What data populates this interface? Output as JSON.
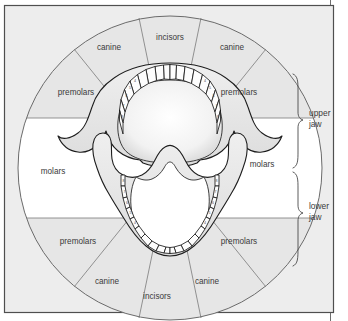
{
  "figure": {
    "frame": {
      "border_color": "#555555",
      "page_background": "#ffffff",
      "plate_background": "#ededed"
    },
    "circle": {
      "center_x": 170,
      "center_y": 168,
      "radius": 152,
      "outline_color": "#6b6b6b",
      "sector_fill": "#e6e6e6",
      "molar_band_fill": "#ffffff"
    }
  },
  "sectors": [
    {
      "id": "incisors-upper",
      "label": "incisors",
      "x": 170,
      "y": 38,
      "group": "incisors",
      "jaw": "upper"
    },
    {
      "id": "canine-upper-left",
      "label": "canine",
      "x": 109,
      "y": 48,
      "group": "canine",
      "jaw": "upper"
    },
    {
      "id": "canine-upper-right",
      "label": "canine",
      "x": 232,
      "y": 48,
      "group": "canine",
      "jaw": "upper"
    },
    {
      "id": "premolars-upper-left",
      "label": "premolars",
      "x": 76,
      "y": 93,
      "group": "premolars",
      "jaw": "upper"
    },
    {
      "id": "premolars-upper-right",
      "label": "premolars",
      "x": 239,
      "y": 93,
      "group": "premolars",
      "jaw": "upper"
    },
    {
      "id": "molars-left",
      "label": "molars",
      "x": 53,
      "y": 172,
      "group": "molars",
      "jaw": "both"
    },
    {
      "id": "molars-right",
      "label": "molars",
      "x": 262,
      "y": 165,
      "group": "molars",
      "jaw": "both"
    },
    {
      "id": "premolars-lower-left",
      "label": "premolars",
      "x": 78,
      "y": 242,
      "group": "premolars",
      "jaw": "lower"
    },
    {
      "id": "premolars-lower-right",
      "label": "premolars",
      "x": 239,
      "y": 242,
      "group": "premolars",
      "jaw": "lower"
    },
    {
      "id": "canine-lower-left",
      "label": "canine",
      "x": 107,
      "y": 282,
      "group": "canine",
      "jaw": "lower"
    },
    {
      "id": "canine-lower-right",
      "label": "canine",
      "x": 207,
      "y": 282,
      "group": "canine",
      "jaw": "lower"
    },
    {
      "id": "incisors-lower",
      "label": "incisors",
      "x": 157,
      "y": 297,
      "group": "incisors",
      "jaw": "lower"
    }
  ],
  "brackets": [
    {
      "id": "upper-jaw",
      "label_line1": "upper",
      "label_line2": "jaw",
      "label_x": 312,
      "label_y1": 114,
      "label_y2": 124,
      "top_y": 74,
      "bottom_y": 170
    },
    {
      "id": "lower-jaw",
      "label_line1": "lower",
      "label_line2": "jaw",
      "label_x": 312,
      "label_y1": 207,
      "label_y2": 217,
      "top_y": 170,
      "bottom_y": 266
    }
  ],
  "tooth_numbers": {
    "upper_left": [
      "8",
      "7",
      "6",
      "5",
      "4"
    ],
    "upper_right": [
      "8",
      "7",
      "6",
      "5",
      "4"
    ],
    "lower_left": [
      "8",
      "7",
      "6",
      "5",
      "4"
    ],
    "lower_right": [
      "8",
      "7",
      "6",
      "5",
      "4"
    ]
  }
}
